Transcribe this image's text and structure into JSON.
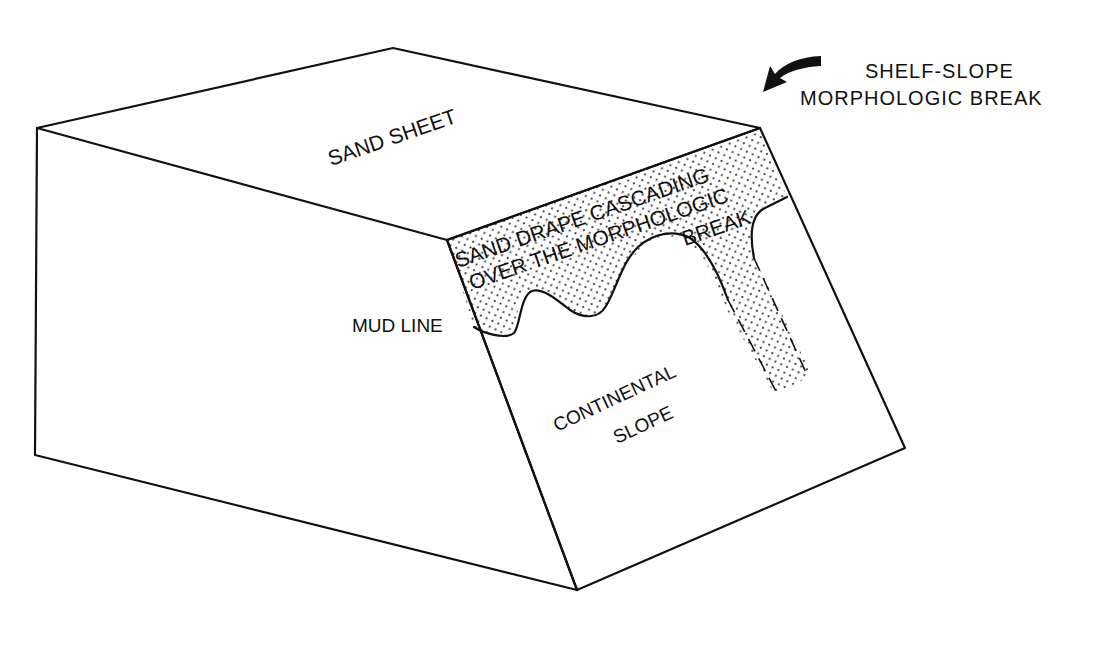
{
  "figure": {
    "type": "block diagram",
    "colors": {
      "ink": "#111111",
      "background": "#ffffff",
      "stipple": "#222222"
    }
  },
  "labels": {
    "sand_sheet": "SAND SHEET",
    "drape_line1": "SAND DRAPE CASCADING",
    "drape_line2": "OVER THE MORPHOLOGIC",
    "drape_line3": "BREAK",
    "mud_line": "MUD LINE",
    "continental": "CONTINENTAL",
    "slope": "SLOPE",
    "callout_line1": "SHELF-SLOPE",
    "callout_line2": "MORPHOLOGIC BREAK"
  },
  "arrow": {
    "icon": "curved-arrow-icon",
    "points_to": "shelf-slope break corner"
  }
}
